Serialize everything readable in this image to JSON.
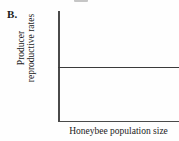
{
  "panel": {
    "letter": "B."
  },
  "chart_data": {
    "type": "line",
    "title": "",
    "subtitle": "",
    "xlabel": "Honeybee population size",
    "ylabel": "Producer reproductive rates",
    "ylabel_lines": [
      "Producer",
      "reproductive rates"
    ],
    "x": [
      0,
      1
    ],
    "series": [
      {
        "name": "Producer reproductive rates",
        "values": [
          0.5,
          0.5
        ],
        "description": "flat horizontal line, constant across the full x-range",
        "color": "#3b3b3b"
      }
    ],
    "xlim": [
      0,
      1
    ],
    "ylim": [
      0,
      1
    ],
    "xticks": [],
    "yticks": [],
    "xticklabels": [],
    "yticklabels": [],
    "grid": false,
    "legend": false,
    "axis_color": "#4a4a4a",
    "background": "#fefefe"
  }
}
